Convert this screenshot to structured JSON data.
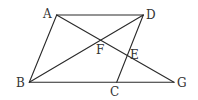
{
  "diagram": {
    "type": "geometry",
    "points": {
      "A": {
        "label": "A",
        "x": 56.7,
        "y": 15
      },
      "D": {
        "label": "D",
        "x": 143.3,
        "y": 15
      },
      "B": {
        "label": "B",
        "x": 29.3,
        "y": 82.3
      },
      "C": {
        "label": "C",
        "x": 116.7,
        "y": 82.3
      },
      "G": {
        "label": "G",
        "x": 174,
        "y": 82.3
      },
      "F": {
        "label": "F",
        "x": 101.3,
        "y": 39.7
      },
      "E": {
        "label": "E",
        "x": 126.7,
        "y": 55
      }
    },
    "segments": [
      "AD",
      "AB",
      "BG",
      "DC",
      "BD",
      "AG"
    ],
    "stroke_color": "#2a2a2a"
  }
}
